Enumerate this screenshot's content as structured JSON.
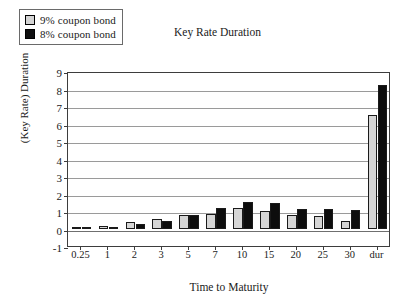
{
  "chart_data": {
    "type": "bar",
    "title": "Key Rate Duration",
    "xlabel": "Time to Maturity",
    "ylabel": "(Key Rate) Duration",
    "categories": [
      "0.25",
      "1",
      "2",
      "3",
      "5",
      "7",
      "10",
      "15",
      "20",
      "25",
      "30",
      "dur"
    ],
    "series": [
      {
        "name": "9% coupon bond",
        "color": "#d6d6d6",
        "values": [
          0.05,
          0.15,
          0.35,
          0.55,
          0.8,
          0.85,
          1.15,
          1.0,
          0.75,
          0.7,
          0.45,
          6.5
        ]
      },
      {
        "name": "8% coupon bond",
        "color": "#0d0d0d",
        "values": [
          0.03,
          0.1,
          0.25,
          0.45,
          0.8,
          1.15,
          1.5,
          1.45,
          1.1,
          1.1,
          1.05,
          8.2
        ]
      }
    ],
    "ylim": [
      -1,
      9
    ],
    "yticks": [
      -1,
      0,
      1,
      2,
      3,
      4,
      5,
      6,
      7,
      8,
      9
    ],
    "ytick_labels": [
      "-1",
      "0",
      "1",
      "2",
      "3",
      "4",
      "5",
      "6",
      "7",
      "8",
      "9"
    ],
    "grid": true,
    "legend_position": "top-left"
  },
  "legend": {
    "items": [
      {
        "label": "9% coupon bond",
        "swatch": "light"
      },
      {
        "label": "8% coupon bond",
        "swatch": "dark"
      }
    ]
  }
}
